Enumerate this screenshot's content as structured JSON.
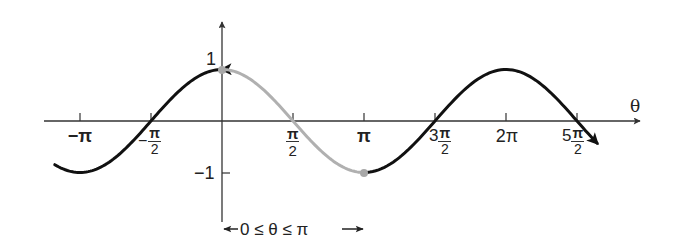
{
  "chart_data": {
    "type": "line",
    "function": "y = cos(theta)",
    "title": "",
    "xlabel": "θ",
    "ylabel": "",
    "xlim": [
      -3.6,
      8.2
    ],
    "ylim": [
      -1.2,
      1.5
    ],
    "grid": false,
    "x_ticks": [
      {
        "value": -3.14159,
        "label": "−π"
      },
      {
        "value": -1.5708,
        "label": "−π/2"
      },
      {
        "value": 1.5708,
        "label": "π/2"
      },
      {
        "value": 3.14159,
        "label": "π"
      },
      {
        "value": 4.71239,
        "label": "3π/2"
      },
      {
        "value": 6.28319,
        "label": "2π"
      },
      {
        "value": 7.85398,
        "label": "5π/2"
      }
    ],
    "y_ticks": [
      {
        "value": 1,
        "label": "1"
      },
      {
        "value": -1,
        "label": "−1"
      }
    ],
    "series": [
      {
        "name": "cos θ (full curve)",
        "color": "#111111",
        "x_range": [
          -3.7,
          8.3
        ],
        "x": [
          -3.14159,
          -1.5708,
          0,
          1.5708,
          3.14159,
          4.71239,
          6.28319,
          7.85398
        ],
        "values": [
          -1,
          0,
          1,
          0,
          -1,
          0,
          1,
          0
        ]
      },
      {
        "name": "cos θ on 0 ≤ θ ≤ π (highlighted)",
        "color": "#b0b0b0",
        "x_range": [
          0,
          3.14159
        ],
        "x": [
          0,
          1.5708,
          3.14159
        ],
        "values": [
          1,
          0,
          -1
        ]
      }
    ],
    "points": [
      {
        "x": 0,
        "y": 1,
        "color": "#a8a8a8"
      },
      {
        "x": 3.14159,
        "y": -1,
        "color": "#a8a8a8"
      }
    ],
    "annotations": [
      {
        "text": "0 ≤ θ ≤ π",
        "type": "interval-arrow",
        "from": 0,
        "to": 3.14159
      }
    ]
  },
  "labels": {
    "theta": "θ",
    "y_one": "1",
    "y_neg_one": "−1",
    "neg_pi": "−π",
    "neg_half_pi_num": "π",
    "neg_half_pi_den": "2",
    "neg_sign": "−",
    "half_pi_num": "π",
    "half_pi_den": "2",
    "pi": "π",
    "three_half_pi_coef": "3",
    "three_half_pi_num": "π",
    "three_half_pi_den": "2",
    "two_pi": "2π",
    "five_half_pi_coef": "5",
    "five_half_pi_num": "π",
    "five_half_pi_den": "2",
    "range": "←0 ≤ θ ≤ π→"
  },
  "colors": {
    "curve": "#111111",
    "highlight": "#b0b0b0",
    "axis": "#333333",
    "dot": "#a8a8a8"
  }
}
